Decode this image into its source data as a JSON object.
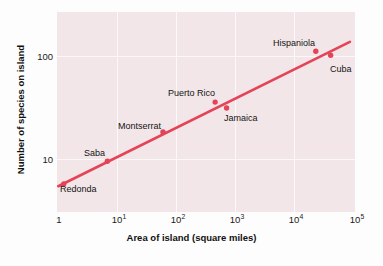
{
  "chart_data": {
    "type": "scatter",
    "title": "",
    "xlabel": "Area of island (square miles)",
    "ylabel": "Number of species on island",
    "xscale": "log",
    "yscale": "log",
    "xlim": [
      1,
      100000
    ],
    "ylim": [
      3.3,
      230
    ],
    "grid": true,
    "legend": "none",
    "xticks": [
      {
        "value": 1,
        "label": "1",
        "mantissa": "1",
        "exponent": ""
      },
      {
        "value": 10,
        "label": "10^1",
        "mantissa": "10",
        "exponent": "1"
      },
      {
        "value": 100,
        "label": "10^2",
        "mantissa": "10",
        "exponent": "2"
      },
      {
        "value": 1000,
        "label": "10^3",
        "mantissa": "10",
        "exponent": "3"
      },
      {
        "value": 10000,
        "label": "10^4",
        "mantissa": "10",
        "exponent": "4"
      },
      {
        "value": 100000,
        "label": "10^5",
        "mantissa": "10",
        "exponent": "5"
      }
    ],
    "yticks": [
      {
        "value": 10,
        "label": "10"
      },
      {
        "value": 100,
        "label": "100"
      }
    ],
    "points": [
      {
        "name": "Redonda",
        "x": 1.3,
        "y": 6,
        "label_pos": "below-right"
      },
      {
        "name": "Saba",
        "x": 7,
        "y": 9.7,
        "label_pos": "above-left"
      },
      {
        "name": "Montserrat",
        "x": 60,
        "y": 18,
        "label_pos": "above-left"
      },
      {
        "name": "Puerto Rico",
        "x": 450,
        "y": 34,
        "label_pos": "above"
      },
      {
        "name": "Jamaica",
        "x": 700,
        "y": 30,
        "label_pos": "below-right"
      },
      {
        "name": "Hispaniola",
        "x": 22000,
        "y": 100,
        "label_pos": "above-left"
      },
      {
        "name": "Cuba",
        "x": 39000,
        "y": 92,
        "label_pos": "below-right"
      }
    ],
    "trendline": {
      "x_start": 1.05,
      "y_start": 5.7,
      "x_end": 82000,
      "y_end": 122,
      "description": "fitted straight line on log-log axes"
    },
    "colors": {
      "accent": "#e34458",
      "plot_background": "#f3e6e8",
      "gridline": "#fcf7f8",
      "text": "#141414",
      "figure_background": "#fdfdfd"
    }
  }
}
